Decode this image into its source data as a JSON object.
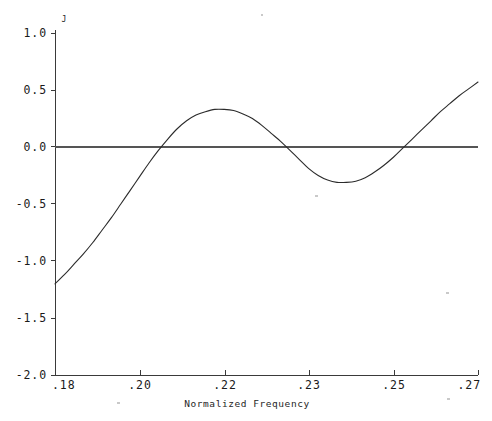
{
  "chart_data": {
    "type": "line",
    "title": "",
    "xlabel": "Normalized Frequency",
    "ylabel": "J",
    "xtick_labels": [
      ".18",
      ".20",
      ".22",
      ".23",
      ".25",
      ".27"
    ],
    "ytick_labels": [
      "1.0",
      "0.5",
      "0.0",
      "-0.5",
      "-1.0",
      "-1.5",
      "-2.0"
    ],
    "ytick_values": [
      1.0,
      0.5,
      0.0,
      -0.5,
      -1.0,
      -1.5,
      -2.0
    ],
    "ylim": [
      -2.0,
      1.0
    ],
    "xlim": [
      0.18,
      0.27
    ],
    "grid": false,
    "legend": null,
    "zero_reference_line": 0.0,
    "series": [
      {
        "name": "J",
        "x": [
          0.18,
          0.182,
          0.184,
          0.186,
          0.188,
          0.19,
          0.192,
          0.194,
          0.196,
          0.198,
          0.2,
          0.202,
          0.204,
          0.206,
          0.208,
          0.21,
          0.212,
          0.214,
          0.216,
          0.218,
          0.22,
          0.222,
          0.224,
          0.226,
          0.228,
          0.23,
          0.232,
          0.234,
          0.236,
          0.238,
          0.24,
          0.242,
          0.244,
          0.246,
          0.248,
          0.25,
          0.252,
          0.254,
          0.256,
          0.258,
          0.26,
          0.262,
          0.264,
          0.266,
          0.268,
          0.27
        ],
        "y": [
          -1.2,
          -1.12,
          -1.03,
          -0.94,
          -0.84,
          -0.73,
          -0.62,
          -0.5,
          -0.38,
          -0.26,
          -0.14,
          -0.03,
          0.07,
          0.16,
          0.23,
          0.28,
          0.31,
          0.33,
          0.33,
          0.32,
          0.29,
          0.25,
          0.19,
          0.12,
          0.05,
          -0.03,
          -0.11,
          -0.19,
          -0.25,
          -0.29,
          -0.31,
          -0.31,
          -0.3,
          -0.27,
          -0.22,
          -0.16,
          -0.09,
          -0.01,
          0.07,
          0.15,
          0.23,
          0.31,
          0.38,
          0.45,
          0.51,
          0.57
        ]
      }
    ],
    "annotations": {
      "zero_crossings": [
        0.2025,
        0.2292,
        0.2542
      ],
      "local_maximum": {
        "x": 0.2152,
        "y": 0.33
      },
      "local_minimum": {
        "x": 0.2405,
        "y": -0.31
      },
      "start_point": {
        "x": 0.18,
        "y": -1.2
      },
      "end_point": {
        "x": 0.27,
        "y": 0.57
      }
    }
  },
  "figure": {
    "background_color": "#ffffff",
    "curve_color": "#2b2b2b",
    "axis_color": "#3a3a3a"
  }
}
